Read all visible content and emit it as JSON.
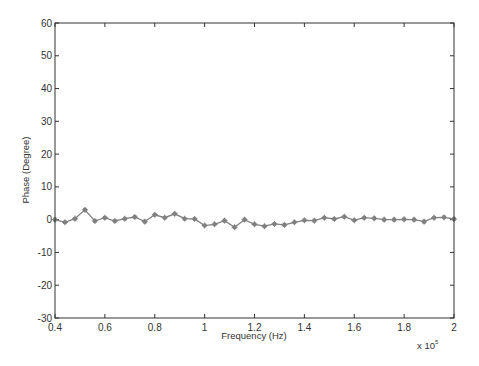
{
  "chart_data": {
    "type": "line",
    "title": "",
    "xlabel": "Frequency (Hz)",
    "ylabel": "Phase (Degree)",
    "x_multiplier_label": "x 10",
    "x_multiplier_exponent": "5",
    "xlim": [
      0.4,
      2.0
    ],
    "ylim": [
      -30,
      60
    ],
    "xticks": [
      0.4,
      0.6,
      0.8,
      1.0,
      1.2,
      1.4,
      1.6,
      1.8,
      2.0
    ],
    "xtick_labels": [
      "0.4",
      "0.6",
      "0.8",
      "1",
      "1.2",
      "1.4",
      "1.6",
      "1.8",
      "2"
    ],
    "yticks": [
      -30,
      -20,
      -10,
      0,
      10,
      20,
      30,
      40,
      50,
      60
    ],
    "ytick_labels": [
      "-30",
      "-20",
      "-10",
      "0",
      "10",
      "20",
      "30",
      "40",
      "50",
      "60"
    ],
    "grid": false,
    "legend": null,
    "series": [
      {
        "name": "Phase",
        "color": "#808080",
        "marker": "asterisk",
        "x": [
          0.4,
          0.44,
          0.48,
          0.52,
          0.56,
          0.6,
          0.64,
          0.68,
          0.72,
          0.76,
          0.8,
          0.84,
          0.88,
          0.92,
          0.96,
          1.0,
          1.04,
          1.08,
          1.12,
          1.16,
          1.2,
          1.24,
          1.28,
          1.32,
          1.36,
          1.4,
          1.44,
          1.48,
          1.52,
          1.56,
          1.6,
          1.64,
          1.68,
          1.72,
          1.76,
          1.8,
          1.84,
          1.88,
          1.92,
          1.96,
          2.0
        ],
        "values": [
          0.0,
          -0.8,
          0.3,
          3.0,
          -0.4,
          0.6,
          -0.4,
          0.3,
          0.8,
          -0.6,
          1.5,
          0.6,
          1.8,
          0.3,
          0.2,
          -1.8,
          -1.4,
          -0.3,
          -2.3,
          0.0,
          -1.4,
          -2.0,
          -1.3,
          -1.6,
          -0.8,
          -0.2,
          -0.3,
          0.6,
          0.2,
          0.9,
          -0.2,
          0.6,
          0.4,
          0.0,
          0.0,
          0.1,
          0.0,
          -0.6,
          0.6,
          0.7,
          0.2
        ]
      }
    ]
  }
}
